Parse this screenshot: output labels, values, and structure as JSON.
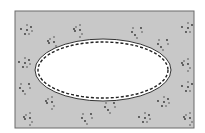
{
  "diagram": {
    "canvas": {
      "width": 205,
      "height": 133,
      "background": "#ffffff"
    },
    "region": {
      "shape": "rectangle",
      "x": 15,
      "y": 11,
      "width": 179,
      "height": 117,
      "fill": "#c8c8c8",
      "stroke": "#6a6a6a",
      "texture": "scattered-dots",
      "dot_color": "#333333"
    },
    "inner_region": {
      "shape": "ellipse",
      "cx": 103,
      "cy": 70,
      "rx": 68,
      "ry": 31,
      "fill": "#ffffff",
      "stroke": "#333333"
    },
    "dashed_boundary": {
      "shape": "ellipse",
      "cx": 103,
      "cy": 70,
      "rx": 65,
      "ry": 28,
      "stroke": "#222222",
      "dash": "3 2"
    },
    "dot_clusters": [
      {
        "cx": 27,
        "cy": 30
      },
      {
        "cx": 80,
        "cy": 30
      },
      {
        "cx": 137,
        "cy": 31
      },
      {
        "cx": 188,
        "cy": 28
      },
      {
        "cx": 54,
        "cy": 42
      },
      {
        "cx": 163,
        "cy": 43
      },
      {
        "cx": 25,
        "cy": 63
      },
      {
        "cx": 188,
        "cy": 64
      },
      {
        "cx": 25,
        "cy": 87
      },
      {
        "cx": 188,
        "cy": 87
      },
      {
        "cx": 52,
        "cy": 102
      },
      {
        "cx": 110,
        "cy": 106
      },
      {
        "cx": 164,
        "cy": 102
      },
      {
        "cx": 30,
        "cy": 118
      },
      {
        "cx": 87,
        "cy": 117
      },
      {
        "cx": 145,
        "cy": 118
      },
      {
        "cx": 190,
        "cy": 118
      }
    ]
  }
}
